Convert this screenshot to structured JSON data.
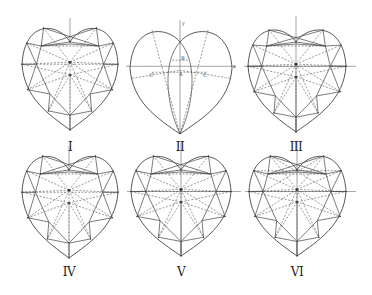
{
  "figure": {
    "title": "",
    "hearts": [
      {
        "id": "I",
        "label": "I",
        "cx": 70,
        "top": 24,
        "notch": 42,
        "left": 22,
        "right": 118,
        "tip": 130,
        "label_y": 141,
        "variant": "brilliant"
      },
      {
        "id": "II",
        "label": "II",
        "cx": 180,
        "top": 28,
        "notch": 42,
        "left": 130,
        "right": 232,
        "tip": 134,
        "label_y": 141,
        "variant": "construction"
      },
      {
        "id": "III",
        "label": "III",
        "cx": 296,
        "top": 26,
        "notch": 42,
        "left": 248,
        "right": 346,
        "tip": 132,
        "label_y": 141,
        "variant": "brilliant-axes"
      },
      {
        "id": "IV",
        "label": "IV",
        "cx": 69,
        "top": 152,
        "notch": 170,
        "left": 22,
        "right": 118,
        "tip": 258,
        "label_y": 266,
        "variant": "brilliant"
      },
      {
        "id": "V",
        "label": "V",
        "cx": 181,
        "top": 152,
        "notch": 170,
        "left": 131,
        "right": 231,
        "tip": 256,
        "label_y": 266,
        "variant": "brilliant-axes"
      },
      {
        "id": "VI",
        "label": "VI",
        "cx": 297,
        "top": 152,
        "notch": 170,
        "left": 249,
        "right": 346,
        "tip": 256,
        "label_y": 266,
        "variant": "brilliant-cross"
      }
    ],
    "construction_labels": {
      "x_axis": "x",
      "y_axis": "y",
      "c_left": "C'",
      "c_right": "C",
      "a": "A",
      "b": "B"
    }
  }
}
